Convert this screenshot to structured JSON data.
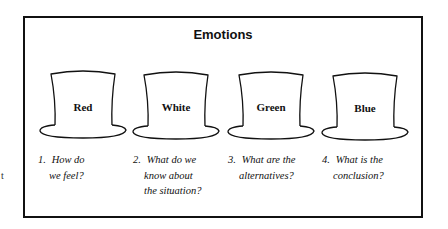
{
  "diagram": {
    "title": "Emotions",
    "edge_fragment": "t",
    "hats": [
      {
        "label": "Red",
        "number": "1.",
        "question_lines": [
          "How do",
          "we feel?"
        ]
      },
      {
        "label": "White",
        "number": "2.",
        "question_lines": [
          "What do we",
          "know about",
          "the situation?"
        ]
      },
      {
        "label": "Green",
        "number": "3.",
        "question_lines": [
          "What are the",
          "alternatives?"
        ]
      },
      {
        "label": "Blue",
        "number": "4.",
        "question_lines": [
          "What is the",
          "conclusion?"
        ]
      }
    ],
    "colors": {
      "line": "#111111",
      "background": "#ffffff"
    }
  }
}
